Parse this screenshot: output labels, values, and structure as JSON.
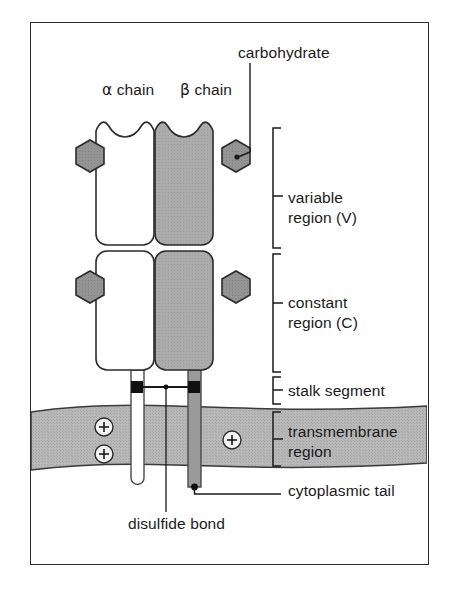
{
  "figure": {
    "type": "biological-schematic"
  },
  "labels": {
    "carbohydrate": "carbohydrate",
    "alpha_chain": "α chain",
    "alpha_chain_greek": "α",
    "alpha_chain_word": "chain",
    "beta_chain": "β chain",
    "beta_chain_greek": "β",
    "beta_chain_word": "chain",
    "variable_region_line1": "variable",
    "variable_region_line2": "region (V)",
    "constant_region_line1": "constant",
    "constant_region_line2": "region (C)",
    "stalk_segment": "stalk segment",
    "transmembrane_line1": "transmembrane",
    "transmembrane_line2": "region",
    "cytoplasmic_tail": "cytoplasmic tail",
    "disulfide_bond": "disulfide bond",
    "charge_symbol": "+"
  },
  "structures": {
    "chains": [
      {
        "name": "alpha chain",
        "fill": "#ffffff",
        "domains": [
          "variable region (V)",
          "constant region (C)"
        ],
        "carbohydrate_count": 2,
        "carbohydrate_side": "left",
        "stalk_fill": "#ffffff",
        "tail_end": "rounded"
      },
      {
        "name": "beta chain",
        "fill": "#a9a9a9",
        "domains": [
          "variable region (V)",
          "constant region (C)"
        ],
        "carbohydrate_count": 2,
        "carbohydrate_side": "right",
        "stalk_fill": "#8f8f8f",
        "tail_end": "dot"
      }
    ],
    "membrane": {
      "label": "transmembrane region",
      "fill": "#b5b5b5",
      "charges": [
        "+",
        "+",
        "+"
      ],
      "charge_count": 3
    },
    "disulfide_bond": {
      "anchors": 2,
      "marker": "filled-square"
    },
    "carbohydrate_marker": {
      "shape": "hexagon",
      "fill": "#8c8c8c",
      "count": 4
    }
  },
  "colors": {
    "frame_border": "#2b2b2b",
    "outline": "#2b2b2b",
    "alpha_fill": "#ffffff",
    "beta_fill": "#a9a9a9",
    "membrane_fill": "#b5b5b5",
    "hexagon_fill": "#8c8c8c",
    "text": "#1a1a1a",
    "background": "#ffffff"
  }
}
